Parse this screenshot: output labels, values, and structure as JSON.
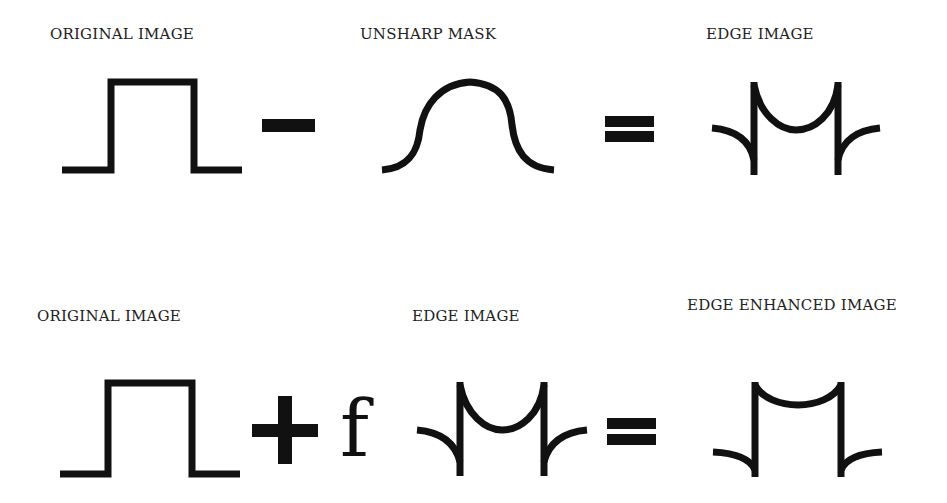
{
  "row1": {
    "labels": {
      "original": "ORIGINAL IMAGE",
      "unsharp": "UNSHARP MASK",
      "edge": "EDGE IMAGE"
    },
    "operators": [
      "minus",
      "equals"
    ]
  },
  "row2": {
    "labels": {
      "original": "ORIGINAL IMAGE",
      "edge": "EDGE IMAGE",
      "enhanced": "EDGE ENHANCED IMAGE"
    },
    "operators": [
      "plus",
      "equals"
    ],
    "factor": "f"
  },
  "colors": {
    "stroke": "#111111",
    "background": "#ffffff",
    "text": "#222222"
  }
}
